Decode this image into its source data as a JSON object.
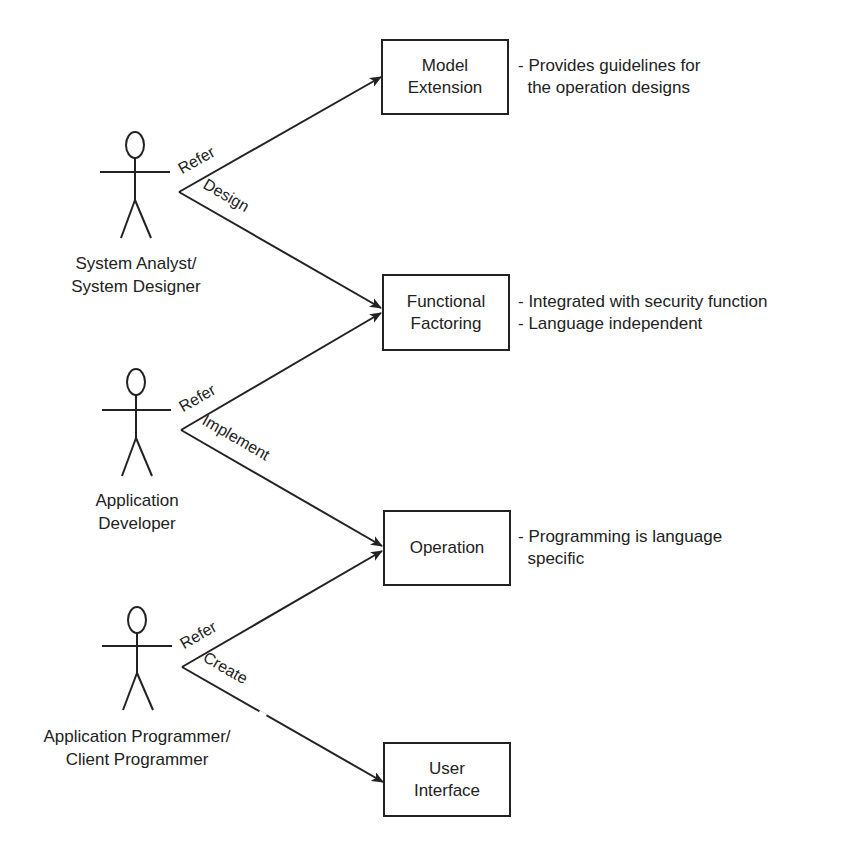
{
  "diagram": {
    "type": "use-case",
    "colors": {
      "stroke": "#222222",
      "text": "#222222",
      "background": "#ffffff"
    },
    "actors": [
      {
        "id": "system-analyst",
        "label_lines": [
          "System Analyst/",
          "System Designer"
        ]
      },
      {
        "id": "application-developer",
        "label_lines": [
          "Application",
          "Developer"
        ]
      },
      {
        "id": "application-programmer",
        "label_lines": [
          "Application Programmer/",
          "Client Programmer"
        ]
      }
    ],
    "boxes": [
      {
        "id": "model-extension",
        "label_lines": [
          "Model",
          "Extension"
        ],
        "notes": [
          "- Provides guidelines for",
          "  the operation designs"
        ]
      },
      {
        "id": "functional-factoring",
        "label_lines": [
          "Functional",
          "Factoring"
        ],
        "notes": [
          "- Integrated with security function",
          "- Language independent"
        ]
      },
      {
        "id": "operation",
        "label_lines": [
          "Operation"
        ],
        "notes": [
          "- Programming is language",
          "  specific"
        ]
      },
      {
        "id": "user-interface",
        "label_lines": [
          "User",
          "Interface"
        ],
        "notes": []
      }
    ],
    "edges": [
      {
        "from": "system-analyst",
        "to": "model-extension",
        "label": "Refer"
      },
      {
        "from": "system-analyst",
        "to": "functional-factoring",
        "label": "Design"
      },
      {
        "from": "application-developer",
        "to": "functional-factoring",
        "label": "Refer"
      },
      {
        "from": "application-developer",
        "to": "operation",
        "label": "Implement"
      },
      {
        "from": "application-programmer",
        "to": "operation",
        "label": "Refer"
      },
      {
        "from": "application-programmer",
        "to": "user-interface",
        "label": "Create"
      }
    ]
  }
}
